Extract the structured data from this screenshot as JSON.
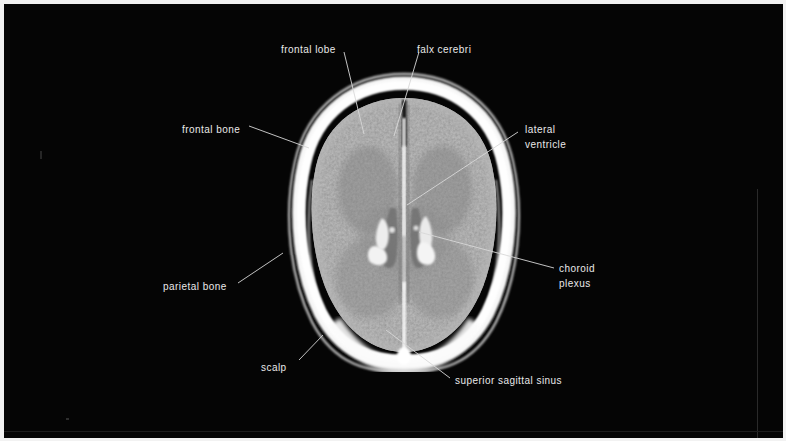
{
  "figure": {
    "kind": "axial-ct-head-scan",
    "modality_caption": "",
    "background_color": "#050505",
    "frame_color": "#f2f2f2",
    "label_color": "#e9e9e9",
    "leader_color": "#d8d8d8"
  },
  "labels": [
    {
      "id": "frontal-lobe",
      "lines": [
        "frontal lobe"
      ],
      "x": 281,
      "y": 42,
      "align": "left"
    },
    {
      "id": "falx-cerebri",
      "lines": [
        "falx cerebri"
      ],
      "x": 417,
      "y": 42,
      "align": "left"
    },
    {
      "id": "frontal-bone",
      "lines": [
        "frontal bone"
      ],
      "x": 182,
      "y": 122,
      "align": "left"
    },
    {
      "id": "lateral-ventricle",
      "lines": [
        "lateral",
        "ventricle"
      ],
      "x": 525,
      "y": 122,
      "align": "left"
    },
    {
      "id": "parietal-bone",
      "lines": [
        "parietal bone"
      ],
      "x": 163,
      "y": 279,
      "align": "left"
    },
    {
      "id": "choroid-plexus",
      "lines": [
        "choroid",
        "plexus"
      ],
      "x": 559,
      "y": 261,
      "align": "left"
    },
    {
      "id": "scalp",
      "lines": [
        "scalp"
      ],
      "x": 261,
      "y": 360,
      "align": "left"
    },
    {
      "id": "superior-sagittal-sinus",
      "lines": [
        "superior sagittal sinus"
      ],
      "x": 455,
      "y": 373,
      "align": "left"
    }
  ],
  "leaders": [
    {
      "id": "leader-frontal-lobe",
      "x1": 344,
      "y1": 52,
      "x2": 364,
      "y2": 134
    },
    {
      "id": "leader-falx-cerebri",
      "x1": 419,
      "y1": 52,
      "x2": 394,
      "y2": 136
    },
    {
      "id": "leader-frontal-bone",
      "x1": 249,
      "y1": 126,
      "x2": 309,
      "y2": 148
    },
    {
      "id": "leader-lateral-ventricle",
      "x1": 518,
      "y1": 132,
      "x2": 407,
      "y2": 205
    },
    {
      "id": "leader-parietal-bone",
      "x1": 238,
      "y1": 283,
      "x2": 283,
      "y2": 253
    },
    {
      "id": "leader-choroid-plexus",
      "x1": 554,
      "y1": 268,
      "x2": 419,
      "y2": 232
    },
    {
      "id": "leader-scalp",
      "x1": 299,
      "y1": 360,
      "x2": 323,
      "y2": 335
    },
    {
      "id": "leader-superior-sagittal-sinus",
      "x1": 450,
      "y1": 378,
      "x2": 386,
      "y2": 330
    }
  ]
}
